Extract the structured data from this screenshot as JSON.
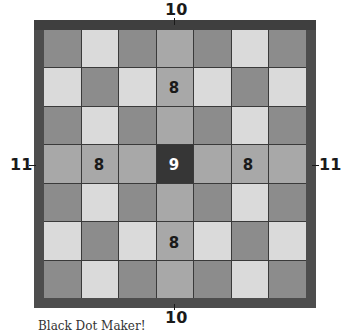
{
  "diagram": {
    "grid_size": 7,
    "pattern": [
      [
        "dark",
        "light",
        "dark",
        "band",
        "dark",
        "light",
        "dark"
      ],
      [
        "light",
        "dark",
        "light",
        "band",
        "light",
        "dark",
        "light"
      ],
      [
        "dark",
        "light",
        "dark",
        "band",
        "dark",
        "light",
        "dark"
      ],
      [
        "band",
        "band",
        "band",
        "center",
        "band",
        "band",
        "band"
      ],
      [
        "dark",
        "light",
        "dark",
        "band",
        "dark",
        "light",
        "dark"
      ],
      [
        "light",
        "dark",
        "light",
        "band",
        "light",
        "dark",
        "light"
      ],
      [
        "dark",
        "light",
        "dark",
        "band",
        "dark",
        "light",
        "dark"
      ]
    ],
    "cell_numbers": {
      "top_band": "8",
      "bottom_band": "8",
      "left_band": "8",
      "right_band": "8",
      "center": "9"
    },
    "edge_labels": {
      "top": "10",
      "bottom": "10",
      "left": "11",
      "right": "11"
    },
    "caption": "Black Dot Maker!"
  },
  "colors": {
    "dark_square": "#8c8c8c",
    "light_square": "#dadada",
    "band": "#a8a8a8",
    "center": "#363636",
    "border": "#4d4d4d"
  }
}
